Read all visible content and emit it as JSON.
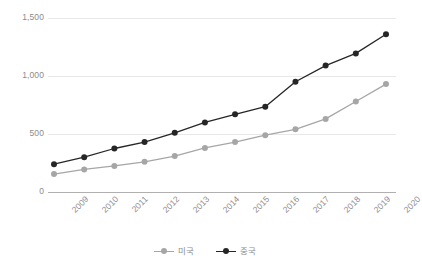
{
  "chart_data": {
    "type": "line",
    "title": "",
    "subtitle": "",
    "xlabel": "",
    "ylabel": "",
    "categories": [
      "2009",
      "2010",
      "2011",
      "2012",
      "2013",
      "2014",
      "2015",
      "2016",
      "2017",
      "2018",
      "2019",
      "2020"
    ],
    "ylim": [
      0,
      1500
    ],
    "yticks": [
      0,
      500,
      1000,
      1500
    ],
    "ytick_labels": [
      "0",
      "500",
      "1,000",
      "1,500"
    ],
    "grid": true,
    "legend_position": "bottom",
    "series": [
      {
        "name": "미국",
        "color": "#a6a6a6",
        "marker": "circle",
        "values": [
          155,
          195,
          225,
          260,
          310,
          380,
          430,
          490,
          540,
          630,
          780,
          930
        ]
      },
      {
        "name": "중국",
        "color": "#262626",
        "marker": "circle",
        "values": [
          240,
          300,
          375,
          430,
          510,
          600,
          670,
          735,
          950,
          1090,
          1195,
          1360
        ]
      }
    ]
  },
  "axis": {
    "y_tick_labels": [
      "1,500",
      "1,000",
      "500",
      "0"
    ],
    "x_tick_labels": [
      "2009",
      "2010",
      "2011",
      "2012",
      "2013",
      "2014",
      "2015",
      "2016",
      "2017",
      "2018",
      "2019",
      "2020"
    ]
  },
  "legend": {
    "items": [
      {
        "label": "미국",
        "color": "#a6a6a6"
      },
      {
        "label": "중국",
        "color": "#262626"
      }
    ]
  },
  "colors": {
    "grid": "#e8e8e8",
    "axis": "#b0b0b0",
    "tick_text": "#8c8c8c",
    "series_usa": "#a6a6a6",
    "series_china": "#262626",
    "background": "#ffffff"
  }
}
